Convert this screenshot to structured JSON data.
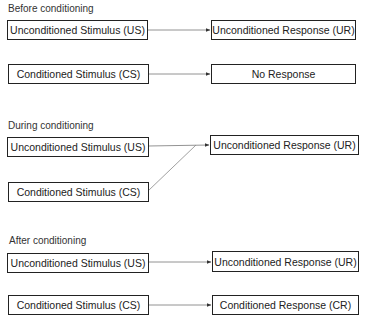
{
  "diagram": {
    "type": "classical-conditioning-flow",
    "sections": [
      {
        "title": "Before conditioning",
        "rows": [
          {
            "stimulus": "Unconditioned Stimulus (US)",
            "response": "Unconditioned Response (UR)"
          },
          {
            "stimulus": "Conditioned Stimulus (CS)",
            "response": "No Response"
          }
        ]
      },
      {
        "title": "During conditioning",
        "rows": [
          {
            "stimulus": "Unconditioned Stimulus (US)",
            "response": "Unconditioned Response (UR)"
          },
          {
            "stimulus": "Conditioned Stimulus (CS)"
          }
        ],
        "note_edges": [
          "US -> UR",
          "CS -> UR"
        ]
      },
      {
        "title": "After conditioning",
        "rows": [
          {
            "stimulus": "Unconditioned Stimulus (US)",
            "response": "Unconditioned Response (UR)"
          },
          {
            "stimulus": "Conditioned Stimulus (CS)",
            "response": "Conditioned Response (CR)"
          }
        ]
      }
    ],
    "colors": {
      "box_border": "#222222",
      "arrow": "#555555",
      "text": "#222222",
      "background": "#ffffff"
    }
  }
}
